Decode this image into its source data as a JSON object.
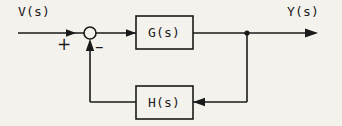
{
  "diagram": {
    "type": "control-system-block-diagram",
    "stroke_color": "#1a1a1a",
    "background_color": "#f4f2ed",
    "signals": {
      "input_label": "V(s)",
      "output_label": "Y(s)"
    },
    "summing_junction": {
      "name": "summing-junction",
      "shape": "circle",
      "cx": 90,
      "cy": 33,
      "r": 6,
      "positive_sign": "+",
      "negative_sign": "–"
    },
    "blocks": [
      {
        "id": "forward-block",
        "label": "G(s)",
        "x": 136,
        "y": 16,
        "width": 57,
        "height": 33
      },
      {
        "id": "feedback-block",
        "label": "H(s)",
        "x": 136,
        "y": 86,
        "width": 57,
        "height": 33
      }
    ],
    "nodes": [
      {
        "id": "takeoff-point",
        "label": "",
        "cx": 247,
        "cy": 33,
        "r": 2.4
      }
    ],
    "connections": [
      {
        "id": "input-to-sum",
        "from": "V(s)",
        "to": "summing-junction",
        "arrow": true
      },
      {
        "id": "sum-to-g",
        "from": "summing-junction",
        "to": "G(s)",
        "arrow": true
      },
      {
        "id": "g-to-takeoff",
        "from": "G(s)",
        "to": "takeoff-point",
        "arrow": false
      },
      {
        "id": "takeoff-to-output",
        "from": "takeoff-point",
        "to": "Y(s)",
        "arrow": true
      },
      {
        "id": "takeoff-to-h",
        "from": "takeoff-point",
        "to": "H(s)",
        "arrow": true
      },
      {
        "id": "h-to-sum",
        "from": "H(s)",
        "to": "summing-junction",
        "arrow": true
      }
    ]
  }
}
